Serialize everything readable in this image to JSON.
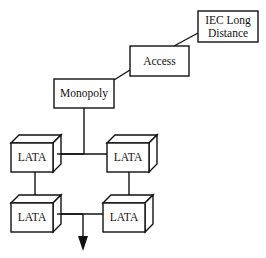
{
  "diagram": {
    "type": "hierarchy",
    "nodes": {
      "iec": {
        "label_line1": "IEC Long",
        "label_line2": "Distance"
      },
      "access": {
        "label": "Access"
      },
      "monopoly": {
        "label": "Monopoly"
      },
      "lata_top_left": {
        "label": "LATA"
      },
      "lata_top_right": {
        "label": "LATA"
      },
      "lata_bottom_left": {
        "label": "LATA"
      },
      "lata_bottom_right": {
        "label": "LATA"
      }
    },
    "edges": [
      [
        "iec",
        "access"
      ],
      [
        "access",
        "monopoly"
      ],
      [
        "monopoly",
        "lata_top_left"
      ],
      [
        "monopoly",
        "lata_top_right"
      ],
      [
        "lata_top_left",
        "lata_bottom_left"
      ],
      [
        "lata_top_right",
        "lata_bottom_right"
      ],
      [
        "lata_bottom_left",
        "lata_bottom_right"
      ]
    ],
    "arrow": {
      "direction": "down"
    },
    "colors": {
      "stroke": "#111111",
      "background": "#ffffff"
    }
  }
}
